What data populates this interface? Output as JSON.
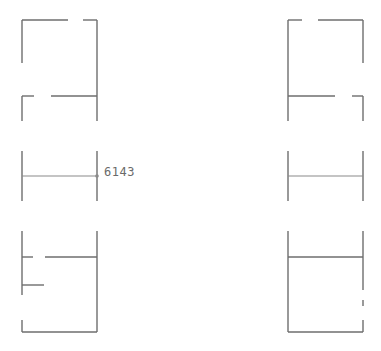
{
  "diagram": {
    "type": "floor-plan-wall-configurations",
    "stroke_color": "#6e6e6e",
    "background": "#ffffff",
    "dimension_label": "6143",
    "caption": "",
    "panels": [
      {
        "id": "top-left",
        "description": "room outline with top-wall door gap and interior partition with opening"
      },
      {
        "id": "top-right",
        "description": "room outline with top-wall door gap (left side) and interior partition with opening (right side)"
      },
      {
        "id": "middle-left",
        "description": "two vertical walls joined by a horizontal member with dimension marker"
      },
      {
        "id": "middle-right",
        "description": "two vertical walls joined by a horizontal member"
      },
      {
        "id": "bottom-left",
        "description": "room outline with partition opening, short stub wall and gap in left wall"
      },
      {
        "id": "bottom-right",
        "description": "room outline with full partition and gaps in right wall"
      }
    ]
  }
}
